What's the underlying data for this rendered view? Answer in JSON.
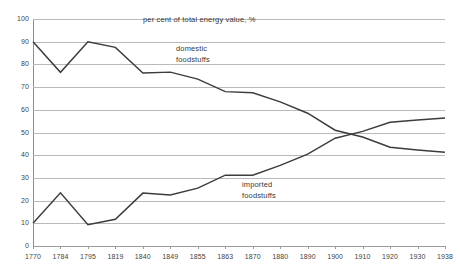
{
  "chart_data": {
    "type": "line",
    "title": "per cent of total energy value, %",
    "xlabel": "",
    "ylabel": "",
    "ylim": [
      0,
      100
    ],
    "ytick_step": 10,
    "grid": true,
    "legend_position": "inline-annotation",
    "categories": [
      "1770",
      "1784",
      "1795",
      "1819",
      "1840",
      "1849",
      "1855",
      "1863",
      "1870",
      "1880",
      "1890",
      "1900",
      "1910",
      "1920",
      "1930",
      "1938"
    ],
    "yticks": [
      "0",
      "10",
      "20",
      "30",
      "40",
      "50",
      "60",
      "70",
      "80",
      "90",
      "100"
    ],
    "series": [
      {
        "name": "domestic foodstuffs",
        "values": [
          90,
          76.5,
          90,
          87.5,
          76.2,
          76.6,
          73.5,
          68,
          67.5,
          63.5,
          58.5,
          51,
          48,
          43.5,
          42.3,
          41.3
        ]
      },
      {
        "name": "imported foodstuffs",
        "values": [
          10,
          23.4,
          9.4,
          11.8,
          23.3,
          22.5,
          25.5,
          31.2,
          31.2,
          35.5,
          40.5,
          47.5,
          50.5,
          54.5,
          55.5,
          56.4
        ]
      }
    ],
    "annotations": [
      {
        "id": "domestic",
        "lines": [
          "domestic",
          "foodstuffs"
        ]
      },
      {
        "id": "imported",
        "lines": [
          "imported",
          "foodstuffs"
        ]
      }
    ],
    "colors": {
      "line": "#3c3c3c",
      "grid": "#b9b9b9",
      "axis": "#8d8d8d",
      "text": "#3a3a3a",
      "background": "#ffffff"
    }
  }
}
